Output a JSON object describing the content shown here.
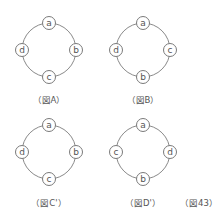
{
  "figures": [
    {
      "id": "A",
      "caption": "（図A）",
      "center": [
        49,
        50
      ],
      "nodes": {
        "top": "a",
        "right": "b",
        "bottom": "c",
        "left": "d"
      }
    },
    {
      "id": "B",
      "caption": "（図B）",
      "center": [
        143,
        50
      ],
      "nodes": {
        "top": "a",
        "right": "c",
        "bottom": "b",
        "left": "d"
      }
    },
    {
      "id": "C'",
      "caption": "（図C'）",
      "center": [
        49,
        152
      ],
      "nodes": {
        "top": "a",
        "right": "b",
        "bottom": "c",
        "left": "d"
      }
    },
    {
      "id": "D'",
      "caption": "（図D'）",
      "center": [
        143,
        152
      ],
      "nodes": {
        "top": "a",
        "right": "d",
        "bottom": "b",
        "left": "c"
      }
    }
  ],
  "figure_number": "（図43）",
  "colors": {
    "stroke": "#8a8a8a",
    "text": "#555555",
    "background": "#ffffff"
  }
}
